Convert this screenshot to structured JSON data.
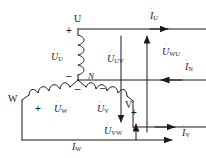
{
  "figure": {
    "width": 206,
    "height": 158,
    "line_color": "#1a1a1a",
    "background": "#ffffff"
  },
  "terminals": [
    {
      "id": "terminal-u",
      "label": "U"
    },
    {
      "id": "terminal-v",
      "label": "V"
    },
    {
      "id": "terminal-w",
      "label": "W"
    },
    {
      "id": "terminal-n",
      "label": "N"
    }
  ],
  "polarity_marks": [
    {
      "id": "plus-u",
      "sign": "+"
    },
    {
      "id": "minus-u",
      "sign": "–"
    },
    {
      "id": "plus-w",
      "sign": "+"
    },
    {
      "id": "minus-w",
      "sign": "–"
    },
    {
      "id": "plus-v",
      "sign": "+"
    },
    {
      "id": "minus-v",
      "sign": "–"
    }
  ],
  "phase_voltages": [
    {
      "id": "u-phase-u",
      "base": "U",
      "sub": "U",
      "dot": "˙"
    },
    {
      "id": "u-phase-v",
      "base": "U",
      "sub": "V",
      "dot": "˙"
    },
    {
      "id": "u-phase-w",
      "base": "U",
      "sub": "W",
      "dot": "˙"
    }
  ],
  "line_voltages": [
    {
      "id": "u-line-uv",
      "base": "U",
      "sub": "UV",
      "dot": "˙"
    },
    {
      "id": "u-line-vw",
      "base": "U",
      "sub": "VW",
      "dot": "˙"
    },
    {
      "id": "u-line-wu",
      "base": "U",
      "sub": "WU",
      "dot": "˙"
    }
  ],
  "currents": [
    {
      "id": "i-line-u",
      "base": "I",
      "sub": "U",
      "dot": "˙"
    },
    {
      "id": "i-line-v",
      "base": "I",
      "sub": "V",
      "dot": "˙"
    },
    {
      "id": "i-line-w",
      "base": "I",
      "sub": "W",
      "dot": "˙"
    },
    {
      "id": "i-neutral",
      "base": "I",
      "sub": "N",
      "dot": "˙"
    }
  ]
}
